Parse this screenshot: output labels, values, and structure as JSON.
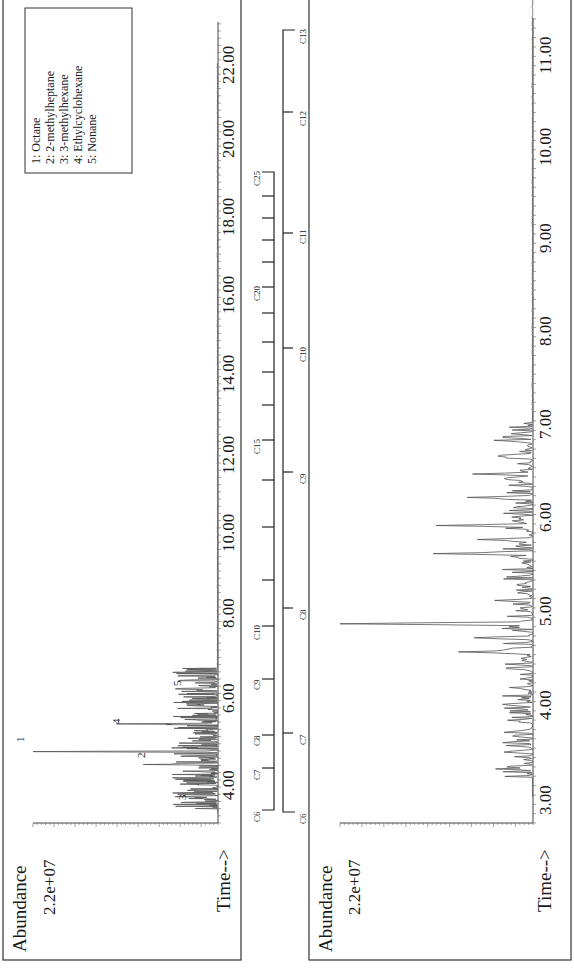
{
  "chart_data": [
    {
      "type": "line",
      "panel": "top",
      "orientation": "rotated 90deg counter-clockwise (time increases upward on page)",
      "title": "",
      "xlabel": "Time-->",
      "ylabel": "Abundance",
      "y_max_label": "2.2e+07",
      "xlim": [
        3.0,
        23.5
      ],
      "ylim": [
        0,
        22000000
      ],
      "x_ticks": [
        "4.00",
        "6.00",
        "8.00",
        "10.00",
        "12.00",
        "14.00",
        "16.00",
        "18.00",
        "20.00",
        "22.00"
      ],
      "peaks": [
        {
          "label": "3",
          "compound": "3-methylhexane",
          "time": 3.6,
          "abundance": 2600000
        },
        {
          "label": "2",
          "compound": "2-methylheptane",
          "time": 4.5,
          "abundance": 8200000
        },
        {
          "label": "1",
          "compound": "Octane",
          "time": 4.85,
          "abundance": 22000000
        },
        {
          "label": "4",
          "compound": "Ethylcyclohexane",
          "time": 5.6,
          "abundance": 11000000
        },
        {
          "label": "5",
          "compound": "Nonane",
          "time": 6.9,
          "abundance": 3800000
        }
      ],
      "legend": {
        "position": "upper right (top-left on page)",
        "entries": [
          "1:  Octane",
          "2:  2-methylheptane",
          "3:  3-methylhexane",
          "4:  Ethylcyclohexane",
          "5:  Nonane"
        ]
      }
    },
    {
      "type": "line",
      "panel": "bottom",
      "orientation": "rotated 90deg counter-clockwise (time increases upward on page)",
      "title": "",
      "xlabel": "Time-->",
      "ylabel": "Abundance",
      "y_max_label": "2.2e+07",
      "xlim": [
        2.8,
        11.8
      ],
      "ylim": [
        0,
        22000000
      ],
      "x_ticks": [
        "3.00",
        "4.00",
        "5.00",
        "6.00",
        "7.00",
        "8.00",
        "9.00",
        "10.00",
        "11.00"
      ],
      "peaks": [
        {
          "time": 3.3,
          "abundance": 2600000
        },
        {
          "time": 3.7,
          "abundance": 2400000
        },
        {
          "time": 4.55,
          "abundance": 8300000
        },
        {
          "time": 4.7,
          "abundance": 6600000
        },
        {
          "time": 4.85,
          "abundance": 22000000
        },
        {
          "time": 5.1,
          "abundance": 3000000
        },
        {
          "time": 5.6,
          "abundance": 11200000
        },
        {
          "time": 5.75,
          "abundance": 6000000
        },
        {
          "time": 5.9,
          "abundance": 10500000
        },
        {
          "time": 6.2,
          "abundance": 7300000
        },
        {
          "time": 6.45,
          "abundance": 6200000
        },
        {
          "time": 6.65,
          "abundance": 3700000
        },
        {
          "time": 6.8,
          "abundance": 2600000
        }
      ]
    }
  ],
  "top_panel": {
    "ylabel": "Abundance",
    "ymax": "2.2e+07",
    "xlabel": "Time-->",
    "ticks": [
      "4.00",
      "6.00",
      "8.00",
      "10.00",
      "12.00",
      "14.00",
      "16.00",
      "18.00",
      "20.00",
      "22.00"
    ],
    "peak_labels": [
      "1",
      "2",
      "3",
      "4",
      "5"
    ],
    "legend": [
      "1:  Octane",
      "2:  2-methylheptane",
      "3:  3-methylhexane",
      "4:  Ethylcyclohexane",
      "5:  Nonane"
    ]
  },
  "bottom_panel": {
    "ylabel": "Abundance",
    "ymax": "2.2e+07",
    "xlabel": "Time-->",
    "ticks": [
      "3.00",
      "4.00",
      "5.00",
      "6.00",
      "7.00",
      "8.00",
      "9.00",
      "10.00",
      "11.00"
    ]
  },
  "carbon_ladder_top": {
    "labels": [
      "C6",
      "C7",
      "C8",
      "C9",
      "C10",
      "C15",
      "C20",
      "C25"
    ]
  },
  "carbon_ladder_bottom": {
    "labels": [
      "C6",
      "C7",
      "C8",
      "C9",
      "C10",
      "C11",
      "C12",
      "C13"
    ]
  }
}
